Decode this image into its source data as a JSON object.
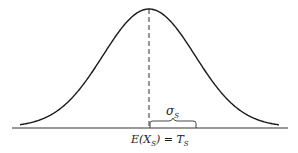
{
  "chart_data": {
    "type": "line",
    "title": "",
    "xlabel": "",
    "ylabel": "",
    "grid": false,
    "legend": null,
    "annotations": {
      "mean_label": "E(X_S) = T_S",
      "sigma_label": "σ_S"
    },
    "series": [
      {
        "name": "normal density",
        "mean": 0,
        "sd": 1
      }
    ]
  },
  "labels": {
    "sigma_symbol": "σ",
    "sigma_sub": "S",
    "mean_E": "E(X",
    "mean_sub": "S",
    "mean_close": ") = T",
    "mean_t_sub": "S"
  },
  "colors": {
    "ink": "#1a1a1a",
    "background": "#ffffff"
  }
}
